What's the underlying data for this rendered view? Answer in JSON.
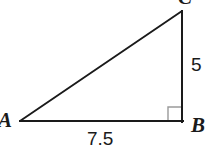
{
  "figure": {
    "kind": "right-triangle-diagram",
    "background_color": "#ffffff",
    "stroke_color": "#1a1a1a",
    "right_angle_color": "#999999",
    "vertices": {
      "a": {
        "label": "A",
        "x": 20,
        "y": 121
      },
      "b": {
        "label": "B",
        "x": 182,
        "y": 121
      },
      "c": {
        "label": "C",
        "x": 182,
        "y": 12
      }
    },
    "sides": {
      "ab": {
        "label": "7.5",
        "from": "A",
        "to": "B",
        "position": "below"
      },
      "cb": {
        "label": "5",
        "from": "C",
        "to": "B",
        "position": "right"
      },
      "ac": {
        "label": "",
        "from": "A",
        "to": "C",
        "position": "hypotenuse"
      }
    },
    "right_angle": {
      "at_vertex": "B",
      "marker": "square",
      "size": 14
    }
  }
}
